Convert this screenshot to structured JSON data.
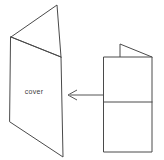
{
  "figure": {
    "background_color": "#ffffff",
    "line_color": "#4a4a4a",
    "text_color": "#3c3c3c",
    "width": 164,
    "height": 160
  },
  "labels": {
    "cover": "cover"
  },
  "arrow": {
    "name": "leftward-arrow",
    "direction": "left",
    "start_x": 103,
    "start_y": 95,
    "end_x": 68,
    "end_y": 95
  },
  "shapes": {
    "open_card": {
      "name": "open-folded-card",
      "description": "Greeting card shown open in perspective with a front cover panel and a back panel angled away",
      "front_panel_points": "11,37 61,57 63,157 10,122",
      "back_panel_points": "11,37 57,5 61,57",
      "fold_edge": "11,37 61,57"
    },
    "flat_card": {
      "name": "flat-folded-card",
      "description": "Card lying flat, folded in half, with a small triangular corner flap turned up at the top",
      "body_points": "104,57 152,57 152,152 104,152",
      "fold_line": "104,102 152,102",
      "flap_points": "120,44 152,57 120,57"
    }
  }
}
